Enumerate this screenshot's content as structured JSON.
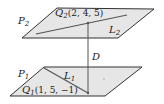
{
  "diagram": {
    "type": "parallel-planes-distance",
    "colors": {
      "plane_fill": "#e6e6e6",
      "plane_edge": "#333333",
      "line": "#555555",
      "background": "#ffffff"
    },
    "planes": [
      {
        "id": "P2",
        "label": "P",
        "subscript": "2",
        "point": {
          "name": "Q",
          "subscript": "2",
          "coords": "(2, 4, 5)"
        },
        "line": {
          "name": "L",
          "subscript": "2"
        }
      },
      {
        "id": "P1",
        "label": "P",
        "subscript": "1",
        "point": {
          "name": "Q",
          "subscript": "1",
          "coords": "(1, 5, −1)"
        },
        "line": {
          "name": "L",
          "subscript": "1"
        }
      }
    ],
    "distance_label": "D"
  }
}
